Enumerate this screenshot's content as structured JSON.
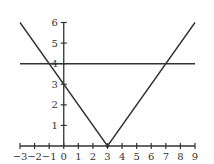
{
  "chart_data": {
    "type": "line",
    "title": "",
    "xlabel": "",
    "ylabel": "",
    "xlim": [
      -3,
      9
    ],
    "ylim": [
      0,
      6
    ],
    "grid": false,
    "legend": null,
    "x_ticks": [
      -3,
      -2,
      -1,
      0,
      1,
      2,
      3,
      4,
      5,
      6,
      7,
      8,
      9
    ],
    "x_tick_labels": [
      "−3",
      "−2",
      "−1",
      "0",
      "1",
      "2",
      "3",
      "4",
      "5",
      "6",
      "7",
      "8",
      "9"
    ],
    "y_ticks": [
      1,
      2,
      3,
      4,
      5,
      6
    ],
    "y_tick_labels": [
      "1",
      "2",
      "3",
      "4",
      "5",
      "6"
    ],
    "series": [
      {
        "name": "y = |x − 3|",
        "x": [
          -3,
          3,
          9
        ],
        "y": [
          6,
          0,
          6
        ]
      },
      {
        "name": "y = 4",
        "x": [
          -3,
          9
        ],
        "y": [
          4,
          4
        ]
      }
    ],
    "annotations": [
      {
        "label": "vertex",
        "x": 3,
        "y": 0
      },
      {
        "label": "y-intercept",
        "x": 0,
        "y": 3
      },
      {
        "label": "intersection",
        "x": -1,
        "y": 4
      },
      {
        "label": "intersection",
        "x": 7,
        "y": 4
      }
    ]
  },
  "colors": {
    "line": "#333333",
    "axis": "#333333",
    "background": "#ffffff"
  }
}
